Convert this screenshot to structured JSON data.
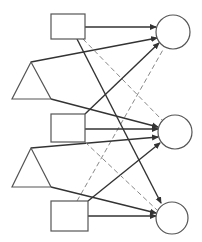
{
  "diagram": {
    "title": "",
    "colors": {
      "background": "#ffffff",
      "node_stroke": "#555555",
      "solid_edge": "#333333",
      "dashed_edge": "#888888"
    },
    "nodes": [
      {
        "id": "sq1",
        "shape": "square",
        "x": 51,
        "y": 14,
        "w": 34,
        "h": 25
      },
      {
        "id": "tri1",
        "shape": "triangle",
        "points": [
          [
            31,
            62
          ],
          [
            12,
            99
          ],
          [
            51,
            99
          ]
        ]
      },
      {
        "id": "sq2",
        "shape": "square",
        "x": 51,
        "y": 114,
        "w": 34,
        "h": 28
      },
      {
        "id": "tri2",
        "shape": "triangle",
        "points": [
          [
            31,
            148
          ],
          [
            12,
            187
          ],
          [
            51,
            187
          ]
        ]
      },
      {
        "id": "sq3",
        "shape": "square",
        "x": 51,
        "y": 201,
        "w": 37,
        "h": 30
      },
      {
        "id": "c1",
        "shape": "circle",
        "cx": 173,
        "cy": 32,
        "r": 17
      },
      {
        "id": "c2",
        "shape": "circle",
        "cx": 175,
        "cy": 132,
        "r": 17
      },
      {
        "id": "c3",
        "shape": "circle",
        "cx": 172,
        "cy": 218,
        "r": 16
      }
    ],
    "edges": [
      {
        "from": "sq1",
        "to": "c1",
        "style": "solid",
        "arrow": true,
        "x1": 85,
        "y1": 27,
        "x2": 156,
        "y2": 27
      },
      {
        "from": "tri1",
        "to": "c1",
        "style": "solid",
        "arrow": true,
        "x1": 31,
        "y1": 62,
        "x2": 157,
        "y2": 38
      },
      {
        "from": "sq2",
        "to": "c1",
        "style": "solid",
        "arrow": true,
        "x1": 85,
        "y1": 114,
        "x2": 159,
        "y2": 43
      },
      {
        "from": "sq3",
        "to": "c1",
        "style": "dashed",
        "arrow": false,
        "x1": 77,
        "y1": 201,
        "x2": 164,
        "y2": 48
      },
      {
        "from": "sq1",
        "to": "c3",
        "style": "solid",
        "arrow": true,
        "x1": 77,
        "y1": 39,
        "x2": 161,
        "y2": 203
      },
      {
        "from": "sq1",
        "to": "c2",
        "style": "dashed",
        "arrow": false,
        "x1": 83,
        "y1": 39,
        "x2": 162,
        "y2": 120
      },
      {
        "from": "tri1",
        "to": "c2",
        "style": "solid",
        "arrow": true,
        "x1": 51,
        "y1": 99,
        "x2": 158,
        "y2": 127
      },
      {
        "from": "sq2",
        "to": "c2",
        "style": "solid",
        "arrow": true,
        "x1": 85,
        "y1": 129,
        "x2": 158,
        "y2": 129
      },
      {
        "from": "tri2",
        "to": "c2",
        "style": "solid",
        "arrow": true,
        "x1": 31,
        "y1": 148,
        "x2": 158,
        "y2": 137
      },
      {
        "from": "sq3",
        "to": "c2",
        "style": "solid",
        "arrow": true,
        "x1": 88,
        "y1": 201,
        "x2": 160,
        "y2": 143
      },
      {
        "from": "sq2",
        "to": "c3",
        "style": "dashed",
        "arrow": false,
        "x1": 85,
        "y1": 142,
        "x2": 157,
        "y2": 210
      },
      {
        "from": "tri2",
        "to": "c3",
        "style": "solid",
        "arrow": true,
        "x1": 51,
        "y1": 187,
        "x2": 156,
        "y2": 213
      },
      {
        "from": "sq3",
        "to": "c3",
        "style": "solid",
        "arrow": true,
        "x1": 88,
        "y1": 216,
        "x2": 156,
        "y2": 216
      }
    ]
  }
}
